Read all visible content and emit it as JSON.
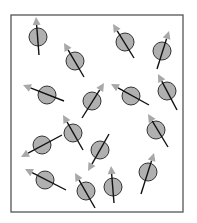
{
  "diagram": {
    "box": {
      "x": 11,
      "y": 15,
      "width": 172,
      "height": 197,
      "stroke": "#555555"
    },
    "colors": {
      "circle_fill": "#b0b0b0",
      "circle_stroke": "#333333",
      "line": "#111111",
      "arrowhead": "#a8a8a8"
    },
    "circle_radius": 9,
    "spins": [
      {
        "cx": 38,
        "cy": 37,
        "tail": [
          39,
          55
        ],
        "head": [
          36,
          17
        ]
      },
      {
        "cx": 75,
        "cy": 61,
        "tail": [
          84,
          77
        ],
        "head": [
          64,
          43
        ]
      },
      {
        "cx": 125,
        "cy": 42,
        "tail": [
          134,
          58
        ],
        "head": [
          113,
          24
        ]
      },
      {
        "cx": 162,
        "cy": 51,
        "tail": [
          157,
          69
        ],
        "head": [
          169,
          31
        ]
      },
      {
        "cx": 47,
        "cy": 95,
        "tail": [
          64,
          101
        ],
        "head": [
          23,
          85
        ]
      },
      {
        "cx": 92,
        "cy": 101,
        "tail": [
          82,
          118
        ],
        "head": [
          104,
          83
        ]
      },
      {
        "cx": 131,
        "cy": 96,
        "tail": [
          149,
          105
        ],
        "head": [
          111,
          84
        ]
      },
      {
        "cx": 167,
        "cy": 91,
        "tail": [
          177,
          110
        ],
        "head": [
          158,
          74
        ]
      },
      {
        "cx": 73,
        "cy": 133,
        "tail": [
          83,
          150
        ],
        "head": [
          63,
          115
        ]
      },
      {
        "cx": 42,
        "cy": 145,
        "tail": [
          62,
          135
        ],
        "head": [
          21,
          157
        ]
      },
      {
        "cx": 100,
        "cy": 150,
        "tail": [
          109,
          134
        ],
        "head": [
          88,
          171
        ]
      },
      {
        "cx": 156,
        "cy": 130,
        "tail": [
          168,
          147
        ],
        "head": [
          148,
          114
        ]
      },
      {
        "cx": 45,
        "cy": 180,
        "tail": [
          66,
          190
        ],
        "head": [
          25,
          169
        ]
      },
      {
        "cx": 86,
        "cy": 191,
        "tail": [
          95,
          208
        ],
        "head": [
          75,
          173
        ]
      },
      {
        "cx": 113,
        "cy": 187,
        "tail": [
          114,
          203
        ],
        "head": [
          111,
          166
        ]
      },
      {
        "cx": 148,
        "cy": 172,
        "tail": [
          141,
          194
        ],
        "head": [
          154,
          153
        ]
      }
    ]
  }
}
